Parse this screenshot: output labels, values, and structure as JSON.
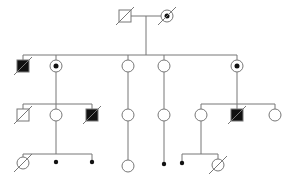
{
  "diagram": {
    "type": "pedigree",
    "stroke": "#777777",
    "fill_affected": "#111111",
    "individuals": [
      {
        "id": "I-1",
        "gen": 1,
        "sex": "male",
        "x": 125,
        "y": 16,
        "affected": false,
        "carrier": false,
        "deceased": true
      },
      {
        "id": "I-2",
        "gen": 1,
        "sex": "female",
        "x": 167,
        "y": 16,
        "affected": false,
        "carrier": true,
        "deceased": true
      },
      {
        "id": "II-1",
        "gen": 2,
        "sex": "male",
        "x": 23,
        "y": 66,
        "affected": true,
        "carrier": false,
        "deceased": true
      },
      {
        "id": "II-2",
        "gen": 2,
        "sex": "female",
        "x": 56,
        "y": 66,
        "affected": false,
        "carrier": true,
        "deceased": false
      },
      {
        "id": "II-3",
        "gen": 2,
        "sex": "female",
        "x": 128,
        "y": 66,
        "affected": false,
        "carrier": false,
        "deceased": false
      },
      {
        "id": "II-4",
        "gen": 2,
        "sex": "female",
        "x": 164,
        "y": 66,
        "affected": false,
        "carrier": false,
        "deceased": false
      },
      {
        "id": "II-5",
        "gen": 2,
        "sex": "female",
        "x": 237,
        "y": 66,
        "affected": false,
        "carrier": true,
        "deceased": false
      },
      {
        "id": "III-1",
        "gen": 3,
        "sex": "male",
        "x": 23,
        "y": 115,
        "affected": false,
        "carrier": false,
        "deceased": true
      },
      {
        "id": "III-2",
        "gen": 3,
        "sex": "female",
        "x": 56,
        "y": 115,
        "affected": false,
        "carrier": false,
        "deceased": false
      },
      {
        "id": "III-3",
        "gen": 3,
        "sex": "male",
        "x": 92,
        "y": 115,
        "affected": true,
        "carrier": false,
        "deceased": true
      },
      {
        "id": "III-4",
        "gen": 3,
        "sex": "female",
        "x": 128,
        "y": 115,
        "affected": false,
        "carrier": false,
        "deceased": false
      },
      {
        "id": "III-5",
        "gen": 3,
        "sex": "female",
        "x": 164,
        "y": 115,
        "affected": false,
        "carrier": false,
        "deceased": false
      },
      {
        "id": "III-6",
        "gen": 3,
        "sex": "female",
        "x": 201,
        "y": 115,
        "affected": false,
        "carrier": false,
        "deceased": false
      },
      {
        "id": "III-7",
        "gen": 3,
        "sex": "male",
        "x": 237,
        "y": 115,
        "affected": true,
        "carrier": false,
        "deceased": true
      },
      {
        "id": "III-8",
        "gen": 3,
        "sex": "female",
        "x": 275,
        "y": 115,
        "affected": false,
        "carrier": false,
        "deceased": false
      },
      {
        "id": "IV-1",
        "gen": 4,
        "sex": "female",
        "x": 23,
        "y": 163,
        "affected": false,
        "carrier": false,
        "deceased": true
      },
      {
        "id": "IV-2",
        "gen": 4,
        "sex": "dot",
        "x": 56,
        "y": 162
      },
      {
        "id": "IV-3",
        "gen": 4,
        "sex": "dot",
        "x": 92,
        "y": 162
      },
      {
        "id": "IV-4",
        "gen": 4,
        "sex": "female",
        "x": 128,
        "y": 166,
        "affected": false,
        "carrier": false,
        "deceased": false
      },
      {
        "id": "IV-5",
        "gen": 4,
        "sex": "dot",
        "x": 164,
        "y": 164
      },
      {
        "id": "IV-6",
        "gen": 4,
        "sex": "dot",
        "x": 182,
        "y": 163
      },
      {
        "id": "IV-7",
        "gen": 4,
        "sex": "female",
        "x": 218,
        "y": 165,
        "affected": false,
        "carrier": false,
        "deceased": true
      }
    ],
    "lines": [
      [
        131,
        16,
        161,
        16
      ],
      [
        146,
        16,
        146,
        55
      ],
      [
        23,
        55,
        237,
        55
      ],
      [
        23,
        55,
        23,
        60
      ],
      [
        56,
        55,
        56,
        60
      ],
      [
        128,
        55,
        128,
        60
      ],
      [
        164,
        55,
        164,
        60
      ],
      [
        237,
        55,
        237,
        60
      ],
      [
        56,
        72,
        56,
        104
      ],
      [
        23,
        104,
        92,
        104
      ],
      [
        23,
        104,
        23,
        109
      ],
      [
        56,
        104,
        56,
        109
      ],
      [
        92,
        104,
        92,
        109
      ],
      [
        128,
        72,
        128,
        109
      ],
      [
        164,
        72,
        164,
        109
      ],
      [
        237,
        72,
        237,
        104
      ],
      [
        201,
        104,
        275,
        104
      ],
      [
        201,
        104,
        201,
        109
      ],
      [
        237,
        104,
        237,
        109
      ],
      [
        275,
        104,
        275,
        109
      ],
      [
        56,
        121,
        56,
        154
      ],
      [
        23,
        154,
        92,
        154
      ],
      [
        23,
        154,
        23,
        157
      ],
      [
        92,
        154,
        92,
        160
      ],
      [
        128,
        121,
        128,
        160
      ],
      [
        164,
        121,
        164,
        162
      ],
      [
        201,
        121,
        201,
        154
      ],
      [
        182,
        154,
        218,
        154
      ],
      [
        182,
        154,
        182,
        161
      ],
      [
        218,
        154,
        218,
        159
      ]
    ]
  }
}
